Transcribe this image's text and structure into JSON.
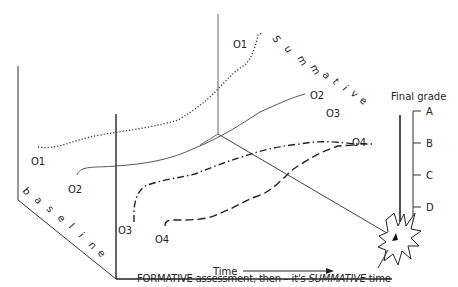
{
  "diagram": {
    "axes": {
      "time_label": "Time",
      "baseline_letters": [
        "b",
        "a",
        "s",
        "e",
        "l",
        "i",
        "n",
        "e"
      ],
      "summative_letters": [
        "S",
        "u",
        "m",
        "m",
        "a",
        "t",
        "i",
        "v",
        "e"
      ]
    },
    "series": [
      {
        "id": "O1",
        "start_label": "O1",
        "end_label": "O1",
        "style": "dotted"
      },
      {
        "id": "O2",
        "start_label": "O2",
        "end_label": "O2",
        "style": "solid"
      },
      {
        "id": "O3",
        "start_label": "O3",
        "end_label": "O3",
        "style": "dash-dot"
      },
      {
        "id": "O4",
        "start_label": "O4",
        "end_label": "O4",
        "style": "dashed"
      }
    ],
    "final_grade": {
      "title": "Final grade",
      "grades": [
        "A",
        "B",
        "C",
        "D"
      ]
    },
    "caption": {
      "prefix": "FORMATIVE assessment, then – it's ",
      "emphasis": "SUMMATIVE",
      "suffix": " time"
    },
    "colors": {
      "line": "#222222",
      "thin_line": "#555555",
      "background": "#ffffff"
    }
  }
}
